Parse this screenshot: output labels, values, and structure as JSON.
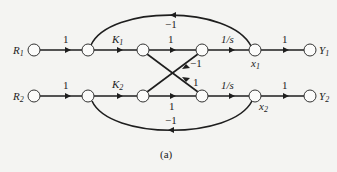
{
  "diagram": {
    "type": "signal-flow-graph",
    "caption": "(a)",
    "nodes": [
      {
        "id": "R1",
        "label": "R",
        "sub": "1",
        "x": 34,
        "y": 50
      },
      {
        "id": "n1a",
        "label": "",
        "x": 88,
        "y": 50
      },
      {
        "id": "n1b",
        "label": "",
        "x": 143,
        "y": 50
      },
      {
        "id": "n1c",
        "label": "",
        "x": 202,
        "y": 50
      },
      {
        "id": "x1",
        "label": "x",
        "sub": "1",
        "x": 255,
        "y": 50
      },
      {
        "id": "Y1",
        "label": "Y",
        "sub": "1",
        "x": 310,
        "y": 50
      },
      {
        "id": "R2",
        "label": "R",
        "sub": "2",
        "x": 34,
        "y": 96
      },
      {
        "id": "n2a",
        "label": "",
        "x": 88,
        "y": 96
      },
      {
        "id": "n2b",
        "label": "",
        "x": 143,
        "y": 96
      },
      {
        "id": "n2c",
        "label": "",
        "x": 202,
        "y": 96
      },
      {
        "id": "x2",
        "label": "x",
        "sub": "2",
        "x": 255,
        "y": 96
      },
      {
        "id": "Y2",
        "label": "Y",
        "sub": "2",
        "x": 310,
        "y": 96
      }
    ],
    "edges": [
      {
        "from": "R1",
        "to": "n1a",
        "gain": "1"
      },
      {
        "from": "n1a",
        "to": "n1b",
        "gain": "K1"
      },
      {
        "from": "n1b",
        "to": "n1c",
        "gain": "1"
      },
      {
        "from": "n1c",
        "to": "x1",
        "gain": "1/s"
      },
      {
        "from": "x1",
        "to": "Y1",
        "gain": "1"
      },
      {
        "from": "x1",
        "to": "n1a",
        "gain": "−1",
        "kind": "feedback-top"
      },
      {
        "from": "R2",
        "to": "n2a",
        "gain": "1"
      },
      {
        "from": "n2a",
        "to": "n2b",
        "gain": "K2"
      },
      {
        "from": "n2b",
        "to": "n2c",
        "gain": "1"
      },
      {
        "from": "n2c",
        "to": "x2",
        "gain": "1/s"
      },
      {
        "from": "x2",
        "to": "Y2",
        "gain": "1"
      },
      {
        "from": "x2",
        "to": "n2a",
        "gain": "−1",
        "kind": "feedback-bottom"
      },
      {
        "from": "n1b",
        "to": "n2c",
        "gain": "1",
        "kind": "cross"
      },
      {
        "from": "n2b",
        "to": "n1c",
        "gain": "−1",
        "kind": "cross"
      }
    ]
  },
  "labels": {
    "R1": "R",
    "R1_sub": "1",
    "R2": "R",
    "R2_sub": "2",
    "Y1": "Y",
    "Y1_sub": "1",
    "Y2": "Y",
    "Y2_sub": "2",
    "x1": "x",
    "x1_sub": "1",
    "x2": "x",
    "x2_sub": "2",
    "g_r1": "1",
    "g_k1": "K",
    "g_k1_sub": "1",
    "g_1a": "1",
    "g_s1": "1/s",
    "g_y1": "1",
    "g_fb1": "−1",
    "g_r2": "1",
    "g_k2": "K",
    "g_k2_sub": "2",
    "g_1b": "1",
    "g_s2": "1/s",
    "g_y2": "1",
    "g_fb2": "−1",
    "g_cross_up": "−1",
    "g_cross_down": "1",
    "caption": "(a)"
  }
}
